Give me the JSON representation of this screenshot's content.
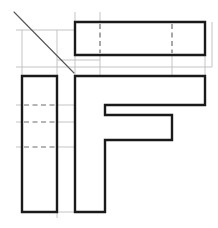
{
  "drawing": {
    "title": "Orthographic Multiview Projection of F-Shaped Block",
    "sheet": {
      "width": 218,
      "height": 228,
      "background": "#ffffff"
    },
    "line_styles": {
      "object_line": {
        "name": "visible-object-line",
        "color": "#1a1a1a",
        "width": 2.4
      },
      "hidden_line": {
        "name": "hidden-dashed-line",
        "color": "#6d6d6d",
        "width": 1.2,
        "dash": "5 3.5"
      },
      "construction_line": {
        "name": "thin-projection-line",
        "color": "#bdbdbd",
        "width": 0.9
      },
      "miter_line": {
        "name": "forty-five-degree-miter-line",
        "color": "#555555",
        "width": 1.1
      }
    },
    "views": [
      {
        "id": "top-view",
        "label": "Top View",
        "shape": "rectangle",
        "bounds": {
          "x": 75,
          "y": 22,
          "width": 130,
          "height": 33
        },
        "outline": "M 75 22 L 205 22 L 205 55 L 75 55 Z",
        "hidden_lines": [
          {
            "name": "hidden-line-left",
            "path": "M 100 24 L 100 53"
          },
          {
            "name": "hidden-line-right",
            "path": "M 172 24 L 172 53"
          }
        ]
      },
      {
        "id": "front-view",
        "label": "Front View",
        "shape": "F-profile",
        "bounds": {
          "x": 75,
          "y": 76,
          "width": 130,
          "height": 136
        },
        "outline": "M 75 76 L 205 76 L 205 105 L 105 105 L 105 115 L 172 115 L 172 140 L 105 140 L 105 212 L 75 212 Z",
        "hidden_lines": []
      },
      {
        "id": "side-view",
        "label": "Left Side View",
        "shape": "rectangle",
        "bounds": {
          "x": 22,
          "y": 76,
          "width": 35,
          "height": 136
        },
        "outline": "M 22 76 L 57 76 L 57 212 L 22 212 Z",
        "hidden_lines": [
          {
            "name": "hidden-line-upper",
            "path": "M 24 105 L 55 105"
          },
          {
            "name": "hidden-line-middle",
            "path": "M 24 122 L 55 122"
          },
          {
            "name": "hidden-line-lower",
            "path": "M 24 147 L 55 147"
          }
        ]
      }
    ],
    "miter_line": {
      "name": "forty-five-degree-projection-line",
      "from": {
        "x": 14,
        "y": 12
      },
      "to": {
        "x": 74,
        "y": 73
      },
      "angle_degrees": 45
    },
    "construction_lines": [
      {
        "name": "proj-vertical-x22",
        "path": "M 22 30 L 22 76"
      },
      {
        "name": "proj-vertical-x57",
        "path": "M 57 30 L 57 76"
      },
      {
        "name": "proj-horizontal-y30",
        "path": "M 16 30 L 100 30"
      },
      {
        "name": "proj-horizontal-y67",
        "path": "M 16 67 L 212 67"
      },
      {
        "name": "proj-horizontal-y60",
        "path": "M 57 60 L 100 60"
      },
      {
        "name": "proj-vertical-x100-gap",
        "path": "M 100 55 L 100 76"
      },
      {
        "name": "proj-vertical-x172-gap",
        "path": "M 172 55 L 172 76"
      },
      {
        "name": "proj-vertical-x205-gap",
        "path": "M 205 55 L 205 76"
      },
      {
        "name": "proj-vertical-x75-upper",
        "path": "M 75 12 L 75 22"
      },
      {
        "name": "proj-vertical-x100-upper",
        "path": "M 100 12 L 100 22"
      },
      {
        "name": "proj-vertical-x212-right",
        "path": "M 212 22 L 212 67"
      },
      {
        "name": "proj-horizontal-y105-left",
        "path": "M 16 105 L 22 105"
      },
      {
        "name": "proj-horizontal-y122-left",
        "path": "M 16 122 L 22 122"
      },
      {
        "name": "proj-horizontal-y147-left",
        "path": "M 16 147 L 22 147"
      },
      {
        "name": "proj-horizontal-y105-gap",
        "path": "M 57 105 L 75 105"
      },
      {
        "name": "proj-horizontal-y122-gap",
        "path": "M 57 122 L 75 122"
      },
      {
        "name": "proj-horizontal-y147-gap",
        "path": "M 57 147 L 75 147"
      },
      {
        "name": "proj-vertical-x57-lower",
        "path": "M 57 212 L 57 218"
      },
      {
        "name": "proj-horizontal-y212-gap",
        "path": "M 57 212 L 75 212"
      },
      {
        "name": "proj-vertical-x75-miter",
        "path": "M 75 22 L 75 76"
      }
    ]
  }
}
